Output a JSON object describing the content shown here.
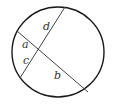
{
  "diagram": {
    "type": "intersecting-chords",
    "circle": {
      "cx": 58,
      "cy": 52,
      "rx": 46,
      "ry": 45,
      "stroke": "#1a1a1a"
    },
    "chords": [
      {
        "name": "chord-cd",
        "x1": 65,
        "y1": 7,
        "x2": 20,
        "y2": 78
      },
      {
        "name": "chord-ab",
        "x1": 17,
        "y1": 31,
        "x2": 88,
        "y2": 92
      }
    ],
    "labels": {
      "a": "a",
      "b": "b",
      "c": "c",
      "d": "d"
    },
    "label_positions": {
      "a": [
        22,
        48
      ],
      "b": [
        54,
        79
      ],
      "c": [
        23,
        64
      ],
      "d": [
        43,
        30
      ]
    }
  }
}
